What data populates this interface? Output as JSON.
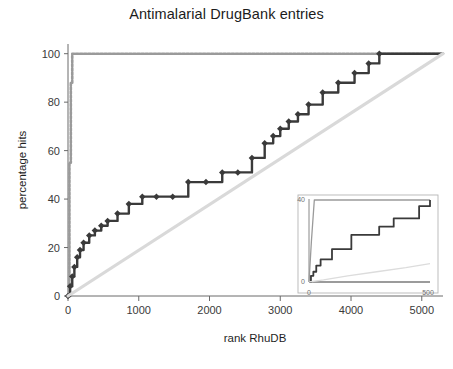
{
  "chart_data": {
    "type": "line",
    "title": "Antimalarial DrugBank entries",
    "xlabel": "rank RhuDB",
    "ylabel": "percentage hits",
    "xlim": [
      0,
      5300
    ],
    "ylim": [
      0,
      104
    ],
    "xticks": [
      0,
      1000,
      2000,
      3000,
      4000,
      5000
    ],
    "xtick_labels": [
      "0",
      "1000",
      "2000",
      "3000",
      "4000",
      "5000"
    ],
    "yticks": [
      0,
      20,
      40,
      60,
      80,
      100
    ],
    "ytick_labels": [
      "0",
      "20",
      "40",
      "60",
      "80",
      "100"
    ],
    "grid": false,
    "legend": "none",
    "series": [
      {
        "name": "ideal",
        "style": "step-dotted",
        "color": "#9a9a9a",
        "x": [
          0,
          20,
          40,
          60,
          5300
        ],
        "values": [
          0,
          55,
          88,
          100,
          100
        ]
      },
      {
        "name": "antimalarial-hits",
        "style": "step-marker",
        "color": "#3a3a3a",
        "x": [
          0,
          30,
          60,
          90,
          130,
          170,
          220,
          300,
          380,
          470,
          560,
          700,
          860,
          1050,
          1250,
          1480,
          1700,
          1950,
          2180,
          2400,
          2600,
          2780,
          2900,
          3000,
          3120,
          3250,
          3400,
          3600,
          3820,
          4050,
          4250,
          4400,
          5300
        ],
        "values": [
          0,
          4,
          8,
          12,
          16,
          19,
          22,
          25,
          27,
          29,
          31,
          34,
          38,
          41,
          41,
          41,
          47,
          47,
          51,
          51,
          57,
          63,
          66,
          69,
          72,
          75,
          79,
          84,
          88,
          92,
          96,
          100,
          100
        ]
      },
      {
        "name": "random-baseline",
        "style": "line",
        "color": "#d9d9d9",
        "x": [
          0,
          5300
        ],
        "values": [
          0,
          100
        ]
      }
    ],
    "inset": {
      "xlim": [
        0,
        500
      ],
      "ylim": [
        0,
        40
      ],
      "xticks": [
        0,
        500
      ],
      "xtick_labels": [
        "0",
        "500"
      ],
      "yticks": [
        0,
        40
      ],
      "ytick_labels": [
        "0",
        "40"
      ],
      "series": [
        {
          "name": "ideal",
          "style": "line",
          "color": "#9a9a9a",
          "x": [
            0,
            10,
            22,
            500
          ],
          "values": [
            0,
            20,
            40,
            40
          ]
        },
        {
          "name": "antimalarial-hits",
          "style": "step",
          "color": "#3a3a3a",
          "x": [
            0,
            8,
            18,
            30,
            48,
            70,
            95,
            130,
            175,
            230,
            290,
            350,
            410,
            455,
            500
          ],
          "values": [
            0,
            3,
            5,
            8,
            11,
            11,
            16,
            16,
            23,
            23,
            27,
            31,
            31,
            37,
            40
          ]
        },
        {
          "name": "random-baseline",
          "style": "line",
          "color": "#dcdcdc",
          "x": [
            0,
            60,
            160,
            280,
            400,
            500
          ],
          "values": [
            0,
            1,
            3,
            5,
            7,
            9
          ]
        }
      ]
    }
  }
}
